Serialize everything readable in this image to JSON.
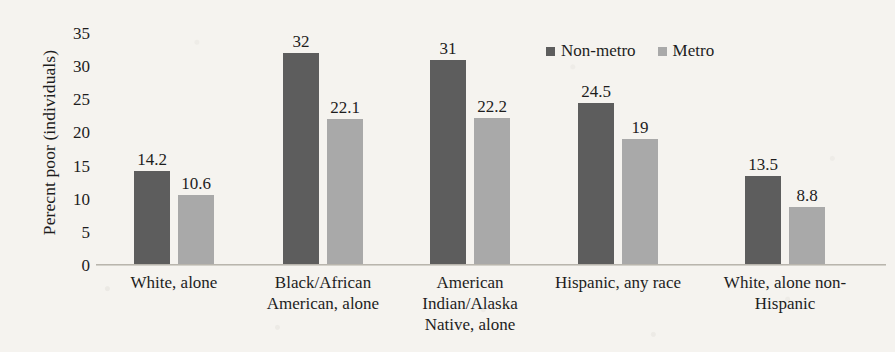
{
  "chart_data": {
    "type": "bar",
    "title": "",
    "xlabel": "",
    "ylabel": "Perecnt poor (individuals)",
    "ylim": [
      0,
      35
    ],
    "yticks": [
      "0",
      "5",
      "10",
      "15",
      "20",
      "25",
      "30",
      "35"
    ],
    "grid": false,
    "legend_position": "top-right",
    "categories": [
      "White, alone",
      "Black/African American, alone",
      "American Indian/Alaska Native, alone",
      "Hispanic, any race",
      "White, alone non-Hispanic"
    ],
    "category_lines": [
      [
        "White, alone"
      ],
      [
        "Black/African",
        "American, alone"
      ],
      [
        "American",
        "Indian/Alaska",
        "Native, alone"
      ],
      [
        "Hispanic, any race"
      ],
      [
        "White, alone non-",
        "Hispanic"
      ]
    ],
    "series": [
      {
        "name": "Non-metro",
        "color": "#5d5d5d",
        "values": [
          14.2,
          32,
          31,
          24.5,
          13.5
        ],
        "labels": [
          "14.2",
          "32",
          "31",
          "24.5",
          "13.5"
        ]
      },
      {
        "name": "Metro",
        "color": "#a9a9a9",
        "values": [
          10.6,
          22.1,
          22.2,
          19,
          8.8
        ],
        "labels": [
          "10.6",
          "22.1",
          "22.2",
          "19",
          "8.8"
        ]
      }
    ]
  },
  "colors": {
    "background": "#f5f3ef",
    "text": "#1d1d1d",
    "axis": "#b9b5ad",
    "nonmetro": "#5d5d5d",
    "metro": "#a9a9a9"
  }
}
